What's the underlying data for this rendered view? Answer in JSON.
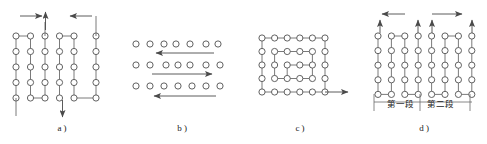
{
  "figure": {
    "title": "",
    "background_color": "#ffffff",
    "line_color": "#6b6b6b",
    "node_stroke": "#5a5a5a",
    "node_fill": "#ffffff",
    "arrow_color": "#4a4a4a",
    "text_color": "#1a1a1a",
    "node_radius": 3.1,
    "panels": [
      {
        "id": "a",
        "caption": "a )",
        "caption_x": 62,
        "caption_y": 131,
        "origin_x": 16,
        "origin_y": 36,
        "col_gap": 14.5,
        "row_gap": 15.5,
        "cols": 6,
        "rows": 5,
        "description": "two-plane lap winding, six coil columns with connecting jogs",
        "columns_x": [
          16,
          30.5,
          45,
          59.5,
          74,
          96
        ],
        "top_arrows": [
          {
            "name": "lead-in-arrow-right",
            "x1": 20,
            "y1": 16,
            "x2": 42,
            "y2": 16,
            "dir": "right"
          },
          {
            "name": "lead-out-arrow-up",
            "x1": 45.5,
            "y1": 30,
            "x2": 45.5,
            "y2": 12,
            "dir": "up"
          },
          {
            "name": "lead-in-arrow-left",
            "x1": 92,
            "y1": 16,
            "x2": 70,
            "y2": 16,
            "dir": "left"
          }
        ],
        "bottom_arrows": [
          {
            "name": "lead-out-arrow-down",
            "x1": 62.5,
            "y1": 100,
            "x2": 62.5,
            "y2": 117,
            "dir": "down"
          }
        ],
        "tails": [
          {
            "name": "tail-left",
            "x1": 16,
            "y1": 98,
            "x2": 16,
            "y2": 116
          },
          {
            "name": "tail-right-vertical",
            "x1": 96,
            "y1": 16,
            "x2": 96,
            "y2": 36
          }
        ]
      },
      {
        "id": "b",
        "caption": "b )",
        "caption_x": 182,
        "caption_y": 131,
        "description": "three horizontal conductor rows with alternating current direction arrows",
        "rows": [
          {
            "name": "conductor-row-1",
            "y": 44,
            "count": 7,
            "xs": [
              136,
              150,
              164,
              176,
              190,
              206,
              218
            ],
            "arrow": {
              "name": "row-1-arrow-left",
              "x1": 214,
              "y1": 53,
              "x2": 156,
              "y2": 53,
              "dir": "left"
            }
          },
          {
            "name": "conductor-row-2",
            "y": 65,
            "count": 7,
            "xs": [
              136,
              150,
              166,
              178,
              190,
              206,
              220
            ],
            "arrow": {
              "name": "row-2-arrow-right",
              "x1": 152,
              "y1": 74,
              "x2": 212,
              "y2": 74,
              "dir": "right"
            }
          },
          {
            "name": "conductor-row-3",
            "y": 86,
            "count": 7,
            "xs": [
              136,
              150,
              164,
              178,
              192,
              206,
              220
            ],
            "arrow": {
              "name": "row-3-arrow-left",
              "x1": 216,
              "y1": 96,
              "x2": 154,
              "y2": 96,
              "dir": "left"
            }
          }
        ]
      },
      {
        "id": "c",
        "caption": "c )",
        "caption_x": 300,
        "caption_y": 131,
        "origin_x": 262,
        "origin_y": 38,
        "col_gap": 12.6,
        "row_gap": 13.5,
        "cols": 6,
        "rows": 5,
        "description": "spiral / concentric winding, inward rectangular spiral path",
        "exit_arrow": {
          "name": "spiral-exit-arrow",
          "x1": 325,
          "y1": 92,
          "x2": 348,
          "y2": 92,
          "dir": "right"
        }
      },
      {
        "id": "d",
        "caption": "d )",
        "caption_x": 424,
        "caption_y": 131,
        "origin_x": 378,
        "origin_y": 36,
        "col_gap": 13.4,
        "row_gap": 14.6,
        "cols": 8,
        "rows": 5,
        "description": "two-section winding with group labels and lead arrows",
        "span_arrows": [
          {
            "name": "section-1-span-arrow-left",
            "x1": 405,
            "y1": 14,
            "x2": 382,
            "y2": 14,
            "dir": "left"
          },
          {
            "name": "section-2-span-arrow-right",
            "x1": 432,
            "y1": 14,
            "x2": 462,
            "y2": 14,
            "dir": "right"
          }
        ],
        "lead_arrows": [
          {
            "name": "lead-arrow-up-1",
            "x": 380,
            "y1": 33,
            "y2": 20,
            "dir": "up"
          },
          {
            "name": "lead-arrow-up-2",
            "x": 418,
            "y1": 33,
            "y2": 20,
            "dir": "up"
          },
          {
            "name": "lead-arrow-up-3",
            "x": 432,
            "y1": 33,
            "y2": 20,
            "dir": "up"
          },
          {
            "name": "lead-arrow-up-4",
            "x": 472,
            "y1": 33,
            "y2": 20,
            "dir": "up"
          }
        ],
        "section_labels": [
          {
            "name": "section-label-1",
            "text": "第一段",
            "x": 400,
            "y": 107
          },
          {
            "name": "section-label-2",
            "text": "第二段",
            "x": 440,
            "y": 107
          }
        ],
        "section_rule": {
          "name": "section-divider-rule",
          "y": 102,
          "x1": 374,
          "x2": 472
        },
        "section_ticks": [
          374,
          420,
          470
        ]
      }
    ]
  }
}
